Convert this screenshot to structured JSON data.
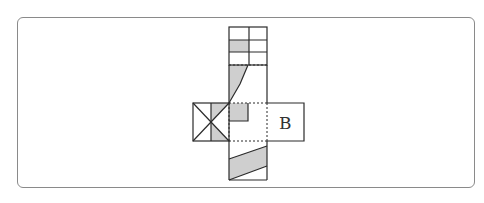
{
  "diagram": {
    "type": "cube-net",
    "labels": {
      "face_b": "B"
    },
    "colors": {
      "stroke": "#2b2b2b",
      "shade": "#cfcfcf",
      "frame": "#8a8a8a"
    }
  }
}
